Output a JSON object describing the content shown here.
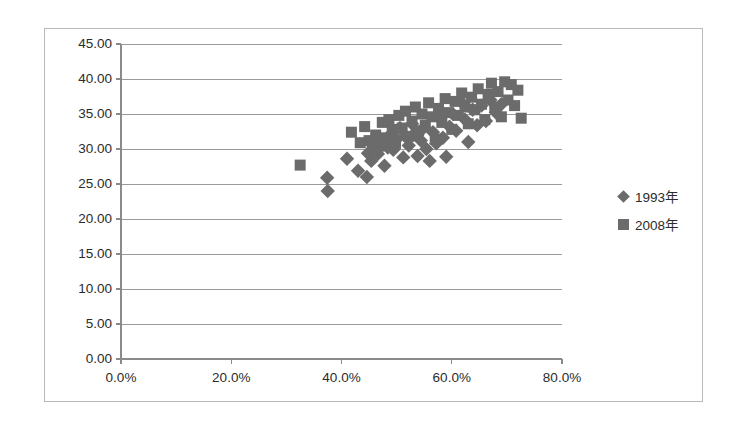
{
  "chart_data": {
    "type": "scatter",
    "title": "",
    "xlabel": "",
    "ylabel": "",
    "xlim": [
      0,
      80
    ],
    "ylim": [
      0,
      45
    ],
    "grid": true,
    "grid_axis": "y",
    "legend_position": "right",
    "x_ticks": [
      "0.0%",
      "20.0%",
      "40.0%",
      "60.0%",
      "80.0%"
    ],
    "x_tick_values": [
      0,
      20,
      40,
      60,
      80
    ],
    "y_ticks": [
      "0.00",
      "5.00",
      "10.00",
      "15.00",
      "20.00",
      "25.00",
      "30.00",
      "35.00",
      "40.00",
      "45.00"
    ],
    "y_tick_values": [
      0,
      5,
      10,
      15,
      20,
      25,
      30,
      35,
      40,
      45
    ],
    "marker_color": "#6b6b6b",
    "series": [
      {
        "name": "1993年",
        "marker": "diamond",
        "color": "#6b6b6b",
        "points": [
          [
            37.4,
            25.9
          ],
          [
            37.5,
            24.0
          ],
          [
            41.0,
            28.6
          ],
          [
            43.0,
            26.9
          ],
          [
            44.6,
            26.0
          ],
          [
            44.8,
            29.4
          ],
          [
            45.4,
            28.3
          ],
          [
            45.8,
            30.6
          ],
          [
            46.6,
            29.3
          ],
          [
            47.2,
            31.0
          ],
          [
            47.8,
            27.6
          ],
          [
            48.4,
            30.2
          ],
          [
            48.8,
            32.0
          ],
          [
            49.4,
            29.9
          ],
          [
            50.0,
            31.4
          ],
          [
            50.6,
            33.0
          ],
          [
            51.2,
            28.8
          ],
          [
            51.6,
            31.8
          ],
          [
            52.2,
            30.5
          ],
          [
            52.8,
            33.6
          ],
          [
            53.2,
            32.2
          ],
          [
            53.8,
            29.0
          ],
          [
            54.4,
            31.2
          ],
          [
            55.0,
            33.1
          ],
          [
            55.4,
            30.0
          ],
          [
            56.0,
            28.3
          ],
          [
            56.6,
            32.4
          ],
          [
            57.2,
            30.8
          ],
          [
            57.8,
            34.4
          ],
          [
            58.4,
            31.6
          ],
          [
            59.0,
            28.9
          ],
          [
            59.6,
            33.2
          ],
          [
            60.2,
            35.0
          ],
          [
            60.8,
            32.6
          ],
          [
            61.6,
            36.8
          ],
          [
            62.4,
            34.2
          ],
          [
            63.0,
            31.0
          ],
          [
            63.8,
            35.6
          ],
          [
            64.6,
            33.4
          ],
          [
            65.4,
            36.2
          ],
          [
            66.2,
            34.0
          ],
          [
            67.0,
            37.0
          ],
          [
            68.0,
            35.2
          ],
          [
            69.0,
            36.4
          ]
        ]
      },
      {
        "name": "2008年",
        "marker": "square",
        "color": "#6b6b6b",
        "points": [
          [
            32.5,
            27.7
          ],
          [
            41.8,
            32.4
          ],
          [
            43.4,
            30.9
          ],
          [
            44.2,
            33.2
          ],
          [
            45.0,
            31.2
          ],
          [
            45.6,
            29.8
          ],
          [
            46.2,
            32.0
          ],
          [
            46.8,
            30.4
          ],
          [
            47.4,
            33.8
          ],
          [
            48.0,
            31.6
          ],
          [
            48.6,
            34.2
          ],
          [
            49.2,
            32.8
          ],
          [
            49.8,
            30.8
          ],
          [
            50.4,
            34.8
          ],
          [
            51.0,
            33.0
          ],
          [
            51.6,
            35.4
          ],
          [
            52.2,
            31.8
          ],
          [
            52.8,
            34.0
          ],
          [
            53.4,
            36.0
          ],
          [
            54.0,
            32.6
          ],
          [
            54.6,
            35.0
          ],
          [
            55.2,
            33.4
          ],
          [
            55.8,
            36.6
          ],
          [
            56.4,
            34.6
          ],
          [
            57.0,
            31.4
          ],
          [
            57.6,
            35.8
          ],
          [
            58.2,
            33.8
          ],
          [
            58.8,
            37.2
          ],
          [
            59.4,
            35.2
          ],
          [
            60.0,
            32.8
          ],
          [
            60.6,
            36.8
          ],
          [
            61.2,
            34.8
          ],
          [
            61.8,
            38.0
          ],
          [
            62.4,
            36.0
          ],
          [
            63.0,
            33.6
          ],
          [
            63.6,
            37.4
          ],
          [
            64.2,
            35.6
          ],
          [
            64.8,
            38.6
          ],
          [
            65.4,
            36.4
          ],
          [
            66.0,
            34.2
          ],
          [
            66.6,
            37.8
          ],
          [
            67.2,
            39.4
          ],
          [
            67.8,
            36.0
          ],
          [
            68.4,
            38.2
          ],
          [
            69.0,
            34.6
          ],
          [
            69.6,
            39.6
          ],
          [
            70.2,
            37.0
          ],
          [
            70.8,
            39.2
          ],
          [
            71.4,
            36.2
          ],
          [
            72.0,
            38.4
          ],
          [
            72.6,
            34.4
          ]
        ]
      }
    ]
  },
  "legend": {
    "items": [
      {
        "label": "1993年",
        "marker": "diamond"
      },
      {
        "label": "2008年",
        "marker": "square"
      }
    ]
  }
}
